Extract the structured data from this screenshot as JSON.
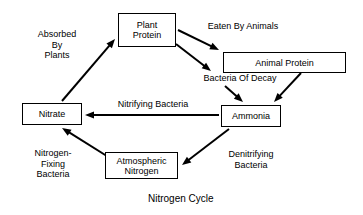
{
  "diagram": {
    "caption": "Nitrogen Cycle",
    "caption_x": 148,
    "caption_y": 193,
    "nodes": [
      {
        "id": "plant-protein",
        "label": "Plant\nProtein",
        "x": 118,
        "y": 13,
        "w": 58,
        "h": 34
      },
      {
        "id": "animal-protein",
        "label": "Animal Protein",
        "x": 223,
        "y": 52,
        "w": 123,
        "h": 21
      },
      {
        "id": "nitrate",
        "label": "Nitrate",
        "x": 22,
        "y": 103,
        "w": 60,
        "h": 22
      },
      {
        "id": "ammonia",
        "label": "Ammonia",
        "x": 221,
        "y": 105,
        "w": 60,
        "h": 22
      },
      {
        "id": "atmospheric-nitrogen",
        "label": "Atmospheric\nNitrogen",
        "x": 105,
        "y": 152,
        "w": 73,
        "h": 27
      }
    ],
    "edge_labels": [
      {
        "id": "absorbed-by-plants",
        "text": "Absorbed\nBy\nPlants",
        "x": 27,
        "y": 29,
        "w": 58
      },
      {
        "id": "eaten-by-animals",
        "text": "Eaten By Animals",
        "x": 199,
        "y": 21,
        "w": 86
      },
      {
        "id": "bacteria-of-decay",
        "text": "Bacteria Of Decay",
        "x": 195,
        "y": 73,
        "w": 88
      },
      {
        "id": "nitrifying-bacteria",
        "text": "Nitrifying Bacteria",
        "x": 107,
        "y": 99,
        "w": 90
      },
      {
        "id": "nitrogen-fixing-bacteria",
        "text": "Nitrogen-\nFixing\nBacteria",
        "x": 25,
        "y": 148,
        "w": 54
      },
      {
        "id": "denitrifying-bacteria",
        "text": "Denitrifying\nBacteria",
        "x": 214,
        "y": 149,
        "w": 72
      }
    ],
    "arrows": [
      {
        "id": "nitrate-to-plant-protein",
        "from": "nitrate",
        "to": "plant-protein",
        "x1": 62,
        "y1": 101,
        "x2": 115,
        "y2": 39
      },
      {
        "id": "plant-protein-to-animal-protein",
        "from": "plant-protein",
        "to": "animal-protein",
        "x1": 178,
        "y1": 30,
        "x2": 219,
        "y2": 50
      },
      {
        "id": "plant-protein-to-decay",
        "from": "plant-protein",
        "to": "bacteria-of-decay",
        "x1": 176,
        "y1": 44,
        "x2": 211,
        "y2": 71
      },
      {
        "id": "decay-to-ammonia",
        "from": "bacteria-of-decay",
        "to": "ammonia",
        "x1": 225,
        "y1": 86,
        "x2": 243,
        "y2": 102
      },
      {
        "id": "animal-protein-to-ammonia",
        "from": "animal-protein",
        "to": "ammonia",
        "x1": 301,
        "y1": 73,
        "x2": 274,
        "y2": 102
      },
      {
        "id": "ammonia-to-nitrate",
        "from": "ammonia",
        "to": "nitrate",
        "x1": 219,
        "y1": 115,
        "x2": 85,
        "y2": 115
      },
      {
        "id": "ammonia-to-atmospheric-nitrogen",
        "from": "ammonia",
        "to": "atmospheric-nitrogen",
        "x1": 229,
        "y1": 129,
        "x2": 182,
        "y2": 165
      },
      {
        "id": "atmospheric-nitrogen-to-nitrate",
        "from": "atmospheric-nitrogen",
        "to": "nitrate",
        "x1": 110,
        "y1": 158,
        "x2": 62,
        "y2": 128
      }
    ],
    "colors": {
      "stroke": "#000000",
      "background": "#ffffff",
      "text": "#000000"
    }
  }
}
